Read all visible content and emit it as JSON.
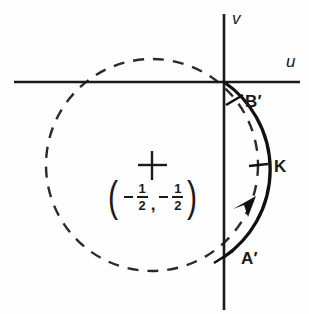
{
  "figure": {
    "kind": "complex-plane-diagram",
    "background_color": "#fefefe",
    "ink_color": "#1a1a1a",
    "width": 309,
    "height": 314
  },
  "axes": {
    "horizontal": {
      "label": "u",
      "y": 82,
      "x_start": 14,
      "x_end": 300
    },
    "vertical": {
      "label": "v",
      "x": 224,
      "y_start": 14,
      "y_end": 310
    },
    "origin": {
      "x": 224,
      "y": 82
    }
  },
  "circle": {
    "style": "dashed",
    "center": {
      "x": 152,
      "y": 165
    },
    "radius": 106,
    "center_marker": "plus-cross",
    "center_label": {
      "open_paren": "(",
      "close_paren": ")",
      "first_sign": "−",
      "first_numerator": "1",
      "first_denominator": "2",
      "separator": ",",
      "second_sign": "−",
      "second_numerator": "1",
      "second_denominator": "2",
      "plain_text": "(−1/2, −1/2)"
    }
  },
  "arc": {
    "name": "K",
    "style": "solid",
    "direction": "counterclockwise",
    "arrow_position": {
      "x": 252,
      "y": 206
    },
    "start_point": "A'",
    "end_point": "B'"
  },
  "points": [
    {
      "id": "B-prime",
      "label": "B′",
      "x": 224,
      "y": 82,
      "tick": true,
      "label_x": 245,
      "label_y": 93
    },
    {
      "id": "K",
      "label": "K",
      "x": 258,
      "y": 165,
      "tick": true,
      "label_x": 274,
      "label_y": 158
    },
    {
      "id": "A-prime",
      "label": "A′",
      "x": 224,
      "y": 257,
      "tick": true,
      "label_x": 241,
      "label_y": 250
    }
  ]
}
